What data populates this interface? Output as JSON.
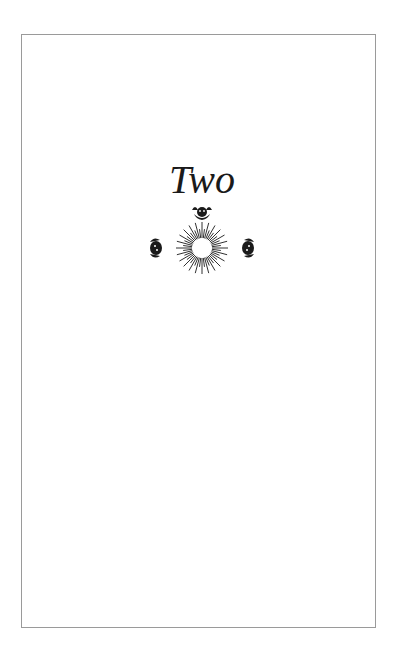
{
  "page": {
    "chapter_title": "Two",
    "ornament": {
      "icon": "sunburst-with-cherubs-icon",
      "color": "#1a1a1a"
    },
    "frame_border_color": "#9a9a9a"
  }
}
